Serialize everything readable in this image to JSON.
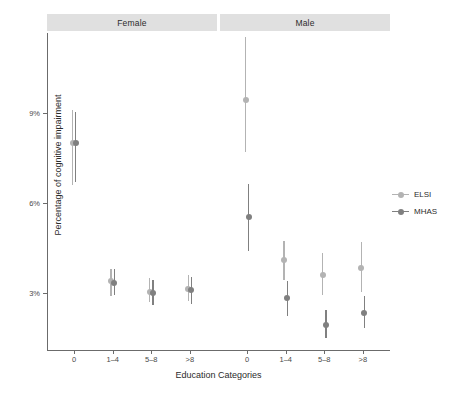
{
  "chart_data": {
    "type": "scatter",
    "title": "",
    "xlabel": "Education Categories",
    "ylabel": "Percentage of cognitive impairment",
    "categories": [
      "0",
      "1–4",
      "5–8",
      ">8"
    ],
    "facets": [
      "Female",
      "Male"
    ],
    "ylim": [
      0.9,
      11.9
    ],
    "yticks": [
      3,
      6,
      9
    ],
    "ytick_labels": [
      "3%",
      "6%",
      "9%"
    ],
    "grid": false,
    "legend_position": "right",
    "legend": [
      "ELSI",
      "MHAS"
    ],
    "colors": {
      "ELSI": "#b3b3b3",
      "MHAS": "#808080",
      "strip": "#e0e0e0",
      "axis": "#6b6b6b"
    },
    "series": [
      {
        "name": "ELSI",
        "color": "#b3b3b3",
        "points": [
          {
            "facet": "Female",
            "category": "0",
            "value": 8.0,
            "low": 6.6,
            "high": 9.1
          },
          {
            "facet": "Female",
            "category": "1–4",
            "value": 3.4,
            "low": 2.9,
            "high": 3.8
          },
          {
            "facet": "Female",
            "category": "5–8",
            "value": 3.05,
            "low": 2.7,
            "high": 3.5
          },
          {
            "facet": "Female",
            "category": ">8",
            "value": 3.15,
            "low": 2.75,
            "high": 3.6
          },
          {
            "facet": "Male",
            "category": "0",
            "value": 9.45,
            "low": 7.7,
            "high": 11.55
          },
          {
            "facet": "Male",
            "category": "1–4",
            "value": 4.1,
            "low": 3.45,
            "high": 4.75
          },
          {
            "facet": "Male",
            "category": "5–8",
            "value": 3.6,
            "low": 2.95,
            "high": 4.35
          },
          {
            "facet": "Male",
            "category": ">8",
            "value": 3.85,
            "low": 3.05,
            "high": 4.7
          }
        ]
      },
      {
        "name": "MHAS",
        "color": "#808080",
        "points": [
          {
            "facet": "Female",
            "category": "0",
            "value": 8.0,
            "low": 6.7,
            "high": 9.05
          },
          {
            "facet": "Female",
            "category": "1–4",
            "value": 3.35,
            "low": 2.95,
            "high": 3.8
          },
          {
            "facet": "Female",
            "category": "5–8",
            "value": 3.0,
            "low": 2.6,
            "high": 3.45
          },
          {
            "facet": "Female",
            "category": ">8",
            "value": 3.1,
            "low": 2.65,
            "high": 3.55
          },
          {
            "facet": "Male",
            "category": "0",
            "value": 5.55,
            "low": 4.4,
            "high": 6.65
          },
          {
            "facet": "Male",
            "category": "1–4",
            "value": 2.85,
            "low": 2.25,
            "high": 3.4
          },
          {
            "facet": "Male",
            "category": "5–8",
            "value": 1.95,
            "low": 1.5,
            "high": 2.45
          },
          {
            "facet": "Male",
            "category": ">8",
            "value": 2.35,
            "low": 1.85,
            "high": 2.9
          }
        ]
      }
    ]
  },
  "axis": {
    "x_title": "Education Categories",
    "y_title": "Percentage of cognitive impairment"
  },
  "strips": {
    "female": "Female",
    "male": "Male"
  },
  "legend": {
    "items": [
      {
        "label": "ELSI",
        "color": "#b3b3b3"
      },
      {
        "label": "MHAS",
        "color": "#808080"
      }
    ]
  }
}
